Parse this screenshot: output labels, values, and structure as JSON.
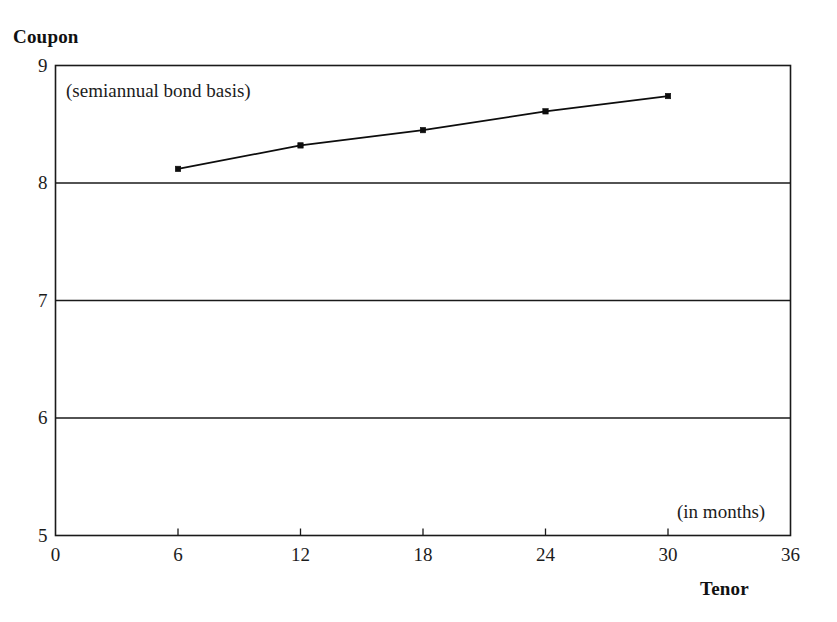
{
  "chart_data": {
    "type": "line",
    "title": "",
    "xlabel": "Tenor",
    "ylabel": "Coupon",
    "xlabel_note": "(in months)",
    "ylabel_note": "(semiannual bond basis)",
    "x": [
      6,
      12,
      18,
      24,
      30
    ],
    "values": [
      8.12,
      8.32,
      8.45,
      8.61,
      8.74
    ],
    "series": [
      {
        "name": "Coupon curve",
        "x": [
          6,
          12,
          18,
          24,
          30
        ],
        "values": [
          8.12,
          8.32,
          8.45,
          8.61,
          8.74
        ]
      }
    ],
    "xlim": [
      0,
      36
    ],
    "ylim": [
      5,
      9
    ],
    "xticks": [
      0,
      6,
      12,
      18,
      24,
      30,
      36
    ],
    "xtick_labels": [
      "0",
      "6",
      "12",
      "18",
      "24",
      "30",
      "36"
    ],
    "yticks": [
      5,
      6,
      7,
      8,
      9
    ],
    "ytick_labels": [
      "5",
      "6",
      "7",
      "8",
      "9"
    ],
    "gridlines_y": [
      6,
      7,
      8
    ],
    "grid": true,
    "legend": false,
    "legend_position": "none",
    "marker": "square",
    "line_color": "#0d0d0d",
    "axis_color": "#1a1a1a",
    "background_color": "#ffffff"
  },
  "labels": {
    "y_axis_title": "Coupon",
    "x_axis_title": "Tenor",
    "note_basis": "(semiannual bond basis)",
    "note_months": "(in months)"
  }
}
